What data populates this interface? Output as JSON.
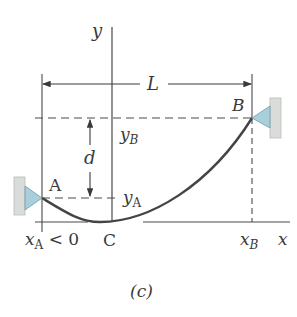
{
  "figure": {
    "caption": "(c)",
    "labels": {
      "y_axis": "y",
      "x_axis": "x",
      "span": "L",
      "point_a": "A",
      "point_b": "B",
      "point_c": "C",
      "y_b": "y",
      "y_b_sub": "B",
      "y_a": "y",
      "y_a_sub": "A",
      "sag": "d",
      "x_a": "x",
      "x_a_sub": "A",
      "x_a_cond": " < 0",
      "x_b": "x",
      "x_b_sub": "B"
    },
    "colors": {
      "line": "#4a4a4a",
      "cable": "#444444",
      "support_fill": "#a9cfdc",
      "wall_fill": "#d9dcd9"
    }
  }
}
